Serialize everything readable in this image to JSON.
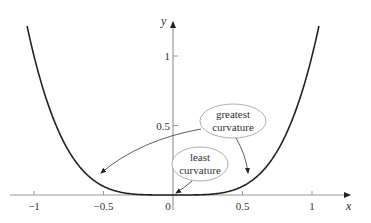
{
  "chart_data": {
    "type": "line",
    "title": "",
    "function": "y = x^4",
    "xlabel": "x",
    "ylabel": "y",
    "xlim": [
      -1.1,
      1.15
    ],
    "ylim": [
      0,
      1.25
    ],
    "grid": false,
    "x_ticks": [
      -1,
      -0.5,
      0,
      0.5,
      1
    ],
    "x_tick_labels": [
      "−1",
      "−0.5",
      "0",
      "0.5",
      "1"
    ],
    "y_ticks": [
      0.5,
      1
    ],
    "y_tick_labels": [
      "0.5",
      "1"
    ],
    "series": [
      {
        "name": "y = x^4",
        "x": [
          -1.05,
          -1.0,
          -0.9,
          -0.8,
          -0.7,
          -0.6,
          -0.5,
          -0.4,
          -0.3,
          -0.2,
          -0.1,
          0,
          0.1,
          0.2,
          0.3,
          0.4,
          0.5,
          0.6,
          0.7,
          0.8,
          0.9,
          1.0,
          1.05
        ],
        "y": [
          1.2155,
          1.0,
          0.6561,
          0.4096,
          0.2401,
          0.1296,
          0.0625,
          0.0256,
          0.0081,
          0.0016,
          0.0001,
          0,
          0.0001,
          0.0016,
          0.0081,
          0.0256,
          0.0625,
          0.1296,
          0.2401,
          0.4096,
          0.6561,
          1.0,
          1.2155
        ]
      }
    ],
    "annotations": [
      {
        "text": [
          "greatest",
          "curvature"
        ],
        "points_to": [
          [
            -0.55,
            0.09
          ],
          [
            0.55,
            0.09
          ]
        ]
      },
      {
        "text": [
          "least",
          "curvature"
        ],
        "points_to": [
          [
            0,
            0
          ]
        ]
      }
    ]
  }
}
